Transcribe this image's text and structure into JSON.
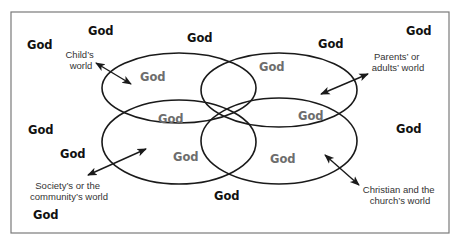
{
  "diagram": {
    "frame": {
      "x": 11,
      "y": 12,
      "width": 438,
      "height": 221,
      "stroke": "#7a7a7a"
    },
    "colors": {
      "outer_god": "#111111",
      "inner_god": "#6d6d6d",
      "lines": "#1a1a1a",
      "labels": "#333333"
    },
    "worlds": [
      {
        "id": "child",
        "label_lines": [
          "Child’s",
          "world"
        ],
        "ellipse": {
          "cx": 179,
          "cy": 88,
          "rx": 77,
          "ry": 35
        }
      },
      {
        "id": "parents",
        "label_lines": [
          "Parents’ or",
          "adults’ world"
        ],
        "ellipse": {
          "cx": 279,
          "cy": 90,
          "rx": 78,
          "ry": 37
        }
      },
      {
        "id": "society",
        "label_lines": [
          "Society’s or the",
          "community’s world"
        ],
        "ellipse": {
          "cx": 179,
          "cy": 142,
          "rx": 77,
          "ry": 42
        }
      },
      {
        "id": "church",
        "label_lines": [
          "Christian and the",
          "church’s world"
        ],
        "ellipse": {
          "cx": 279,
          "cy": 141,
          "rx": 78,
          "ry": 43
        }
      }
    ],
    "outer_god_labels": [
      {
        "text": "God",
        "x": 27,
        "y": 49
      },
      {
        "text": "God",
        "x": 88,
        "y": 35
      },
      {
        "text": "God",
        "x": 187,
        "y": 42
      },
      {
        "text": "God",
        "x": 318,
        "y": 48
      },
      {
        "text": "God",
        "x": 406,
        "y": 35
      },
      {
        "text": "God",
        "x": 28,
        "y": 134
      },
      {
        "text": "God",
        "x": 60,
        "y": 158
      },
      {
        "text": "God",
        "x": 396,
        "y": 133
      },
      {
        "text": "God",
        "x": 33,
        "y": 219
      },
      {
        "text": "God",
        "x": 214,
        "y": 200
      }
    ],
    "inner_god_labels": [
      {
        "text": "God",
        "x": 140,
        "y": 81,
        "region": "child only"
      },
      {
        "text": "God",
        "x": 259,
        "y": 71,
        "region": "parents only"
      },
      {
        "text": "God",
        "x": 158,
        "y": 123,
        "region": "child ∩ society"
      },
      {
        "text": "God",
        "x": 298,
        "y": 120,
        "region": "parents ∩ church"
      },
      {
        "text": "God",
        "x": 173,
        "y": 161,
        "region": "society only"
      },
      {
        "text": "God",
        "x": 270,
        "y": 163,
        "region": "church only"
      }
    ],
    "text_labels": {
      "child": {
        "line1": "Child’s",
        "line2": "world"
      },
      "parents": {
        "line1": "Parents’ or",
        "line2": "adults’ world"
      },
      "society": {
        "line1": "Society’s or the",
        "line2": "community’s world"
      },
      "church": {
        "line1": "Christian and the",
        "line2": "church’s world"
      }
    }
  }
}
